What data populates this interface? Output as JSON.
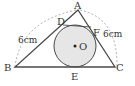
{
  "diagram": {
    "type": "geometry-incircle-triangle",
    "colors": {
      "stroke": "#4a4a4a",
      "circle_fill": "#e6e6e6",
      "dashed": "#9a9a9a",
      "text": "#333333"
    },
    "points": {
      "A": {
        "label": "A",
        "x": 78,
        "y": 10
      },
      "B": {
        "label": "B",
        "x": 15,
        "y": 67
      },
      "C": {
        "label": "C",
        "x": 115,
        "y": 67
      },
      "D": {
        "label": "D",
        "x": 62,
        "y": 25
      },
      "E": {
        "label": "E",
        "x": 75,
        "y": 67
      },
      "F": {
        "label": "F",
        "x": 93,
        "y": 30
      },
      "O": {
        "label": "O",
        "x": 75,
        "y": 46
      }
    },
    "circle": {
      "center": "O",
      "radius": 21
    },
    "measurements": {
      "left_arc_label": "6cm",
      "right_arc_label": "6cm"
    },
    "labels": {
      "A": "A",
      "B": "B",
      "C": "C",
      "D": "D",
      "E": "E",
      "F": "F",
      "O": "O",
      "dot": "•"
    }
  }
}
